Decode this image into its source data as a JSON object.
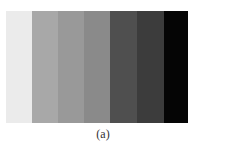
{
  "figure": {
    "caption": "(a)",
    "bars": [
      {
        "label": "step-1",
        "color": "#ebebeb",
        "width": 26
      },
      {
        "label": "step-2",
        "color": "#a8a8a8",
        "width": 26
      },
      {
        "label": "step-3",
        "color": "#999999",
        "width": 26
      },
      {
        "label": "step-4",
        "color": "#8a8a8a",
        "width": 26
      },
      {
        "label": "step-5",
        "color": "#4f4f4f",
        "width": 27
      },
      {
        "label": "step-6",
        "color": "#3c3c3c",
        "width": 27
      },
      {
        "label": "step-7",
        "color": "#050505",
        "width": 24
      }
    ]
  }
}
